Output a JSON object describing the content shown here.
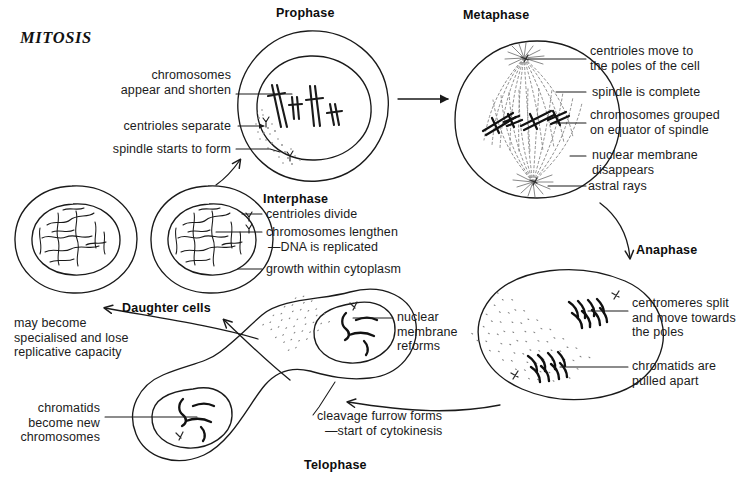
{
  "title": "MITOSIS",
  "stages": {
    "prophase": "Prophase",
    "metaphase": "Metaphase",
    "anaphase": "Anaphase",
    "telophase": "Telophase",
    "interphase": "Interphase",
    "daughter_cells": "Daughter cells"
  },
  "labels": {
    "chromosomes_appear": "chromosomes\nappear and shorten",
    "centrioles_separate": "centrioles separate",
    "spindle_starts": "spindle starts to form",
    "centrioles_move": "centrioles move to\nthe poles of the cell",
    "spindle_complete": "spindle is complete",
    "chromosomes_grouped": "chromosomes grouped\non equator of spindle",
    "nuclear_membrane_disappears": "nuclear membrane\ndisappears",
    "astral_rays": "astral rays",
    "centromeres_split": "centromeres split\nand move towards\nthe poles",
    "chromatids_pulled": "chromatids are\npulled apart",
    "nuclear_membrane_reforms": "nuclear\nmembrane\nreforms",
    "cleavage_furrow": "cleavage furrow forms",
    "start_cytokinesis": "—start of cytokinesis",
    "chromatids_become": "chromatids\nbecome new\nchromosomes",
    "may_become": "may become\nspecialised and lose\nreplicative capacity",
    "centrioles_divide": "centrioles divide",
    "chromosomes_lengthen": "chromosomes lengthen",
    "dna_replicated": "—DNA is replicated",
    "growth_cytoplasm": "growth within cytoplasm"
  },
  "colors": {
    "ink": "#1a1a1a",
    "background": "#ffffff",
    "stipple": "#6b6b6b"
  }
}
